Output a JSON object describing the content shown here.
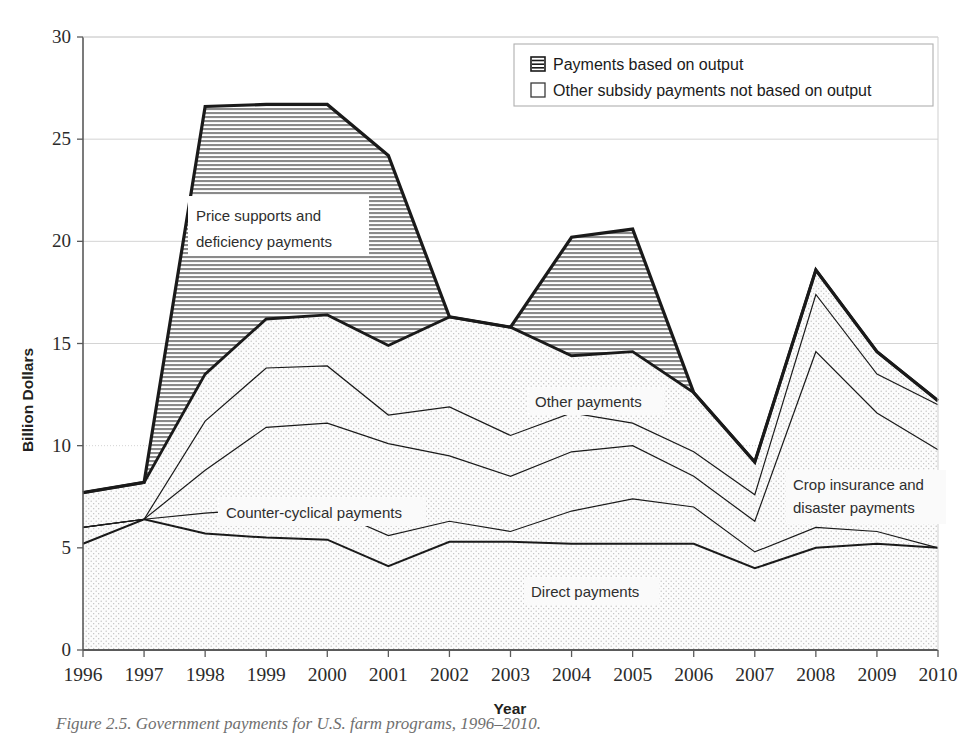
{
  "figure": {
    "caption": "Figure 2.5. Government payments for U.S. farm programs, 1996–2010."
  },
  "legend": {
    "position": "top-right",
    "items": [
      {
        "label": "Payments based on output",
        "swatch": "hatched-horizontal-lines-swatch"
      },
      {
        "label": "Other subsidy payments not based on output",
        "swatch": "empty-white-square-swatch"
      }
    ]
  },
  "annotations": [
    {
      "name": "price-supports-annotation",
      "line1": "Price supports and",
      "line2": "deficiency payments"
    },
    {
      "name": "counter-cyclical-annotation",
      "line1": "Counter-cyclical payments",
      "line2": ""
    },
    {
      "name": "other-payments-annotation",
      "line1": "Other payments",
      "line2": ""
    },
    {
      "name": "crop-insurance-annotation",
      "line1": "Crop insurance and",
      "line2": "disaster payments"
    },
    {
      "name": "direct-payments-annotation",
      "line1": "Direct payments",
      "line2": ""
    }
  ],
  "colors": {
    "plot_background": "#fafafa",
    "axis_line": "#5a5a5a",
    "grid_line": "#d4d4d4",
    "series_outline": "#1a1a1a",
    "hatch_fill": "#b5b5b5",
    "dotted_fill": "#f2f2f2"
  },
  "chart_data": {
    "type": "area",
    "title": "",
    "subtitle": "",
    "xlabel": "Year",
    "ylabel": "Billion Dollars",
    "xlim": [
      1996,
      2010
    ],
    "ylim": [
      0,
      30
    ],
    "ytick_step": 5,
    "yticks": [
      0,
      5,
      10,
      15,
      20,
      25,
      30
    ],
    "grid": true,
    "legend_position": "top right",
    "stacked": true,
    "stack_order_bottom_to_top": [
      "Direct payments",
      "Crop insurance and disaster payments",
      "Counter-cyclical payments",
      "Other payments",
      "Price supports and deficiency payments"
    ],
    "categories": [
      1996,
      1997,
      1998,
      1999,
      2000,
      2001,
      2002,
      2003,
      2004,
      2005,
      2006,
      2007,
      2008,
      2009,
      2010
    ],
    "x": [
      1996,
      1997,
      1998,
      1999,
      2000,
      2001,
      2002,
      2003,
      2004,
      2005,
      2006,
      2007,
      2008,
      2009,
      2010
    ],
    "series": [
      {
        "name": "Direct payments",
        "note": "lowest band, cumulative top boundary",
        "values": [
          5.2,
          6.4,
          5.7,
          5.5,
          5.4,
          4.1,
          5.3,
          5.3,
          5.2,
          5.2,
          5.2,
          4.0,
          5.0,
          5.2,
          5.0
        ],
        "cumulative_top": [
          5.2,
          6.4,
          5.7,
          5.5,
          5.4,
          4.1,
          5.3,
          5.3,
          5.2,
          5.2,
          5.2,
          4.0,
          5.0,
          5.2,
          5.0
        ]
      },
      {
        "name": "Crop insurance and disaster payments",
        "values": [
          0.8,
          0.0,
          1.0,
          1.4,
          1.5,
          1.5,
          1.0,
          0.5,
          1.6,
          2.2,
          1.8,
          0.8,
          1.0,
          0.6,
          0.0
        ],
        "cumulative_top": [
          6.0,
          6.4,
          6.7,
          6.9,
          6.9,
          5.6,
          6.3,
          5.8,
          6.8,
          7.4,
          7.0,
          4.8,
          6.0,
          5.8,
          5.0
        ]
      },
      {
        "name": "Counter-cyclical payments",
        "values": [
          0.0,
          0.0,
          2.1,
          4.0,
          4.2,
          4.5,
          3.2,
          2.7,
          2.9,
          2.6,
          1.5,
          1.5,
          8.6,
          5.8,
          4.8
        ],
        "cumulative_top": [
          6.0,
          6.4,
          8.8,
          10.9,
          11.1,
          10.1,
          9.5,
          8.5,
          9.7,
          10.0,
          8.5,
          6.3,
          14.6,
          11.6,
          9.8
        ]
      },
      {
        "name": "Other payments",
        "values": [
          0.0,
          0.0,
          2.4,
          2.9,
          2.8,
          1.4,
          2.4,
          2.0,
          1.9,
          1.1,
          1.2,
          1.3,
          2.8,
          1.9,
          2.2
        ],
        "cumulative_top": [
          6.0,
          6.4,
          11.2,
          13.8,
          13.9,
          11.5,
          11.9,
          10.5,
          11.6,
          11.1,
          9.7,
          7.6,
          17.4,
          13.5,
          12.0
        ]
      },
      {
        "name": "Price supports and deficiency payments",
        "values": [
          1.7,
          1.8,
          2.3,
          2.4,
          2.5,
          3.4,
          4.4,
          5.3,
          2.8,
          3.5,
          2.9,
          1.6,
          1.2,
          1.1,
          0.2
        ],
        "cumulative_top": [
          7.7,
          8.2,
          13.5,
          16.2,
          16.4,
          14.9,
          16.3,
          15.8,
          14.4,
          14.6,
          12.6,
          9.2,
          18.6,
          14.6,
          12.2
        ]
      }
    ],
    "total_top_boundary": {
      "name": "Total government payments (top outline, payments based on output)",
      "values": [
        7.7,
        8.2,
        26.6,
        26.7,
        26.7,
        24.2,
        16.3,
        15.8,
        20.2,
        20.6,
        12.6,
        9.2,
        18.6,
        14.6,
        12.2
      ]
    },
    "hatched_band_lower_boundary": {
      "name": "Other subsidy payments not based on output (upper edge of dotted region)",
      "values": [
        7.7,
        8.2,
        13.5,
        16.2,
        16.4,
        14.9,
        16.3,
        15.8,
        14.4,
        14.6,
        12.6,
        9.2,
        18.6,
        14.6,
        12.2
      ]
    },
    "annotations_on_plot": [
      "Price supports and deficiency payments",
      "Counter-cyclical payments",
      "Other payments",
      "Crop insurance and disaster payments",
      "Direct payments"
    ]
  }
}
